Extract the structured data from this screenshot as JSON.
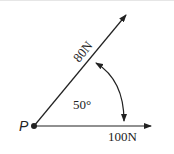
{
  "diagram": {
    "type": "force-vector-diagram",
    "point_label": "P",
    "forces": [
      {
        "label": "80N",
        "magnitude": 80,
        "unit": "N",
        "direction": "upper-right"
      },
      {
        "label": "100N",
        "magnitude": 100,
        "unit": "N",
        "direction": "horizontal-right"
      }
    ],
    "angle": {
      "label": "50°",
      "value": 50,
      "unit": "deg"
    },
    "colors": {
      "line": "#222222",
      "background": "#ffffff"
    }
  }
}
